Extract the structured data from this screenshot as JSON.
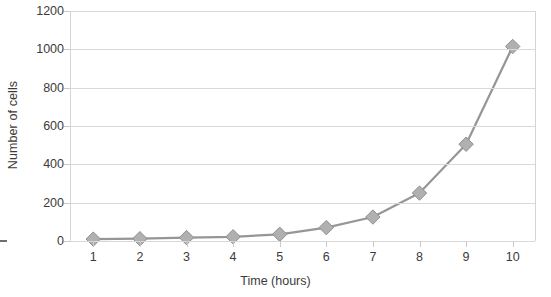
{
  "chart_data": {
    "type": "line",
    "title": "",
    "xlabel": "Time (hours)",
    "ylabel": "Number of cells",
    "x": [
      1,
      2,
      3,
      4,
      5,
      6,
      7,
      8,
      9,
      10
    ],
    "values": [
      10,
      12,
      18,
      22,
      35,
      70,
      125,
      250,
      505,
      1015
    ],
    "categories": [
      "1",
      "2",
      "3",
      "4",
      "5",
      "6",
      "7",
      "8",
      "9",
      "10"
    ],
    "xtick_labels": [
      "1",
      "2",
      "3",
      "4",
      "5",
      "6",
      "7",
      "8",
      "9",
      "10"
    ],
    "ytick_labels": [
      "0",
      "200",
      "400",
      "600",
      "800",
      "1000",
      "1200"
    ],
    "yticks": [
      0,
      200,
      400,
      600,
      800,
      1000,
      1200
    ],
    "ylim": [
      0,
      1200
    ],
    "xlim": [
      0.5,
      10.5
    ],
    "grid": "horizontal",
    "legend": "none",
    "marker": "diamond",
    "series_color": "#969696",
    "marker_color": "#b0b0b0",
    "marker_edge_color": "#8f8f8f",
    "gridline_color": "#d9d9d9",
    "axis_color": "#d4d4d4",
    "text_color": "#3b3b3b",
    "background_color": "#ffffff"
  }
}
